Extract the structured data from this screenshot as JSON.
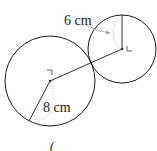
{
  "diagram": {
    "type": "two-tangent-circles",
    "colors": {
      "stroke": "#1a1a1a",
      "dashed": "#b0b0b0",
      "text": "#222222",
      "background": "#ffffff"
    },
    "large_circle": {
      "cx": 50,
      "cy": 81,
      "r": 45,
      "radius_label": "8 cm"
    },
    "small_circle": {
      "cx": 122,
      "cy": 49,
      "r": 34,
      "radius_label": "6 cm"
    },
    "labels": {
      "small_radius": "6 cm",
      "large_radius": "8 cm",
      "caption_mark": "("
    }
  }
}
